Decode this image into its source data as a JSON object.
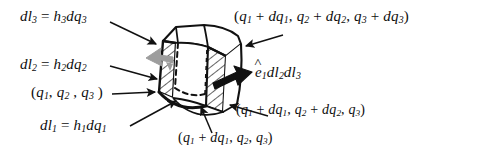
{
  "figure": {
    "background_color": "#ffffff",
    "ink_color": "#111111",
    "gray_arrow_color": "#9a9a9a",
    "labels": {
      "dl3": {
        "lhs": "dl",
        "lhs_sub": "3",
        "eq": " = ",
        "rhs": "h",
        "rhs_sub": "3",
        "rhs2": "dq",
        "rhs2_sub": "3",
        "plain": "dl3 = h3dq3"
      },
      "dl2": {
        "lhs": "dl",
        "lhs_sub": "2",
        "eq": " = ",
        "rhs": "h",
        "rhs_sub": "2",
        "rhs2": "dq",
        "rhs2_sub": "2",
        "plain": "dl2 = h2dq2"
      },
      "dl1": {
        "lhs": "dl",
        "lhs_sub": "1",
        "eq": " = ",
        "rhs": "h",
        "rhs_sub": "1",
        "rhs2": "dq",
        "rhs2_sub": "1",
        "plain": "dl1 = h1dq1"
      },
      "origin_point": {
        "plain": "(q1, q2 , q3 )"
      },
      "corner_all_plus": {
        "plain": "(q1 + dq1, q2 + dq2, q3 + dq3)"
      },
      "corner_q1q2_plus": {
        "plain": "(q1 + dq1, q2 + dq2, q3)"
      },
      "corner_q1_plus": {
        "plain": "(q1 + dq1, q2, q3)"
      },
      "area_vector": {
        "plain": "e1 dl2 dl3",
        "hat_on": "e"
      }
    },
    "annotations": [
      {
        "name": "dl3-leader",
        "from": "label dl3",
        "to": "top-left edge of element"
      },
      {
        "name": "dl2-leader",
        "from": "label dl2",
        "to": "left face of element"
      },
      {
        "name": "dl1-leader",
        "from": "label dl1",
        "to": "bottom front edge of element"
      },
      {
        "name": "origin-leader",
        "from": "label (q1,q2,q3)",
        "to": "near-bottom-left vertex"
      },
      {
        "name": "corner-all-plus-leader",
        "from": "label (q1+dq1,q2+dq2,q3+dq3)",
        "to": "top-right vertex"
      },
      {
        "name": "corner-q1q2-plus-leader",
        "from": "label (q1+dq1,q2+dq2,q3)",
        "to": "bottom-right vertex"
      },
      {
        "name": "corner-q1-plus-leader",
        "from": "label (q1+dq1,q2,q3)",
        "to": "bottom-middle vertex"
      }
    ]
  }
}
